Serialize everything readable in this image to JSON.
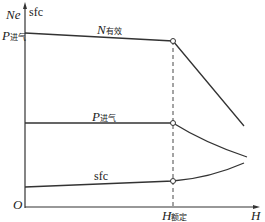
{
  "diagram": {
    "axes": {
      "y_label_left": "Ne",
      "y_label_right": "sfc",
      "y_tick_label_main": "P",
      "y_tick_label_sub": "进气",
      "origin": "O",
      "x_label": "H",
      "x_tick_main": "H",
      "x_tick_sub": "额定"
    },
    "curves": {
      "n": {
        "main": "N",
        "sub": "有效"
      },
      "p": {
        "main": "P",
        "sub": "进气"
      },
      "sfc": {
        "label": "sfc"
      }
    },
    "colors": {
      "line": "#333333",
      "background": "#ffffff"
    }
  }
}
